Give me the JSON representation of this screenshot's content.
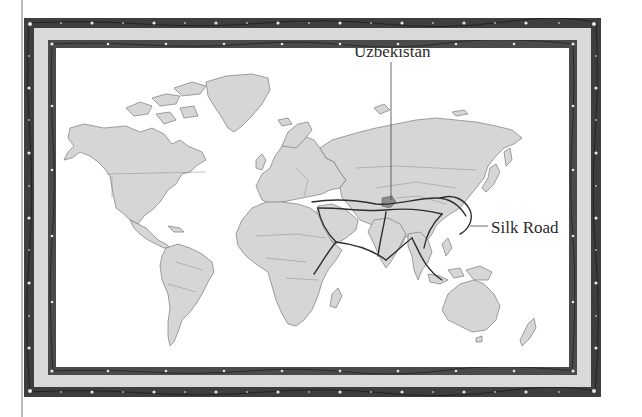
{
  "figure": {
    "type": "illustrated world map in decorative frame"
  },
  "labels": {
    "uzbekistan": "Uzbekistan",
    "silk_road": "Silk Road"
  },
  "colors": {
    "frame_dark": "#3e3e3e",
    "frame_inner": "#4a4a4a",
    "mat": "#d9d9d9",
    "land": "#d6d6d6",
    "land_border": "#7a7a7a",
    "ocean": "#ffffff",
    "route": "#2e2e2e",
    "highlight_uzbekistan": "#8e8e8e",
    "flower_ornament": "#e8e8e8"
  },
  "frame": {
    "style": "double border with floral vine ornament",
    "ornament_icon": "flower-vine"
  }
}
